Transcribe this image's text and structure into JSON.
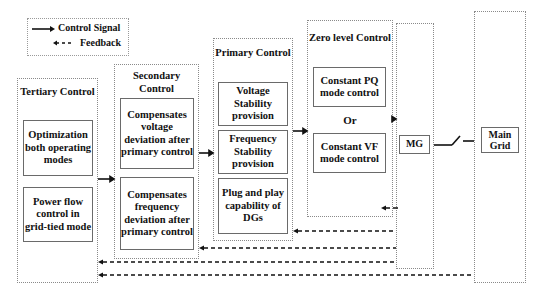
{
  "legend": {
    "control_signal": "Control Signal",
    "feedback": "Feedback"
  },
  "tertiary": {
    "title": "Tertiary Control",
    "items": [
      "Optimization both operating modes",
      "Power flow control in grid-tied mode"
    ]
  },
  "secondary": {
    "title": "Secondary Control",
    "items": [
      "Compensates voltage deviation after primary control",
      "Compensates frequency deviation after primary control"
    ]
  },
  "primary": {
    "title": "Primary Control",
    "items": [
      "Voltage Stability provision",
      "Frequency Stability provision",
      "Plug and play capability of DGs"
    ]
  },
  "zero_level": {
    "title": "Zero level Control",
    "items": [
      "Constant PQ mode control",
      "Constant VF mode control"
    ],
    "separator": "Or"
  },
  "mg": {
    "label": "MG"
  },
  "main_grid": {
    "label": "Main Grid"
  },
  "colors": {
    "line": "#111111",
    "border": "#8a8a8a"
  }
}
